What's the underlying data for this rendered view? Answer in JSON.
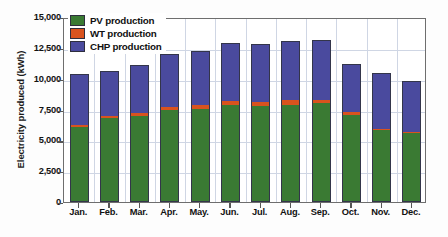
{
  "chart_data": {
    "type": "bar",
    "subtype": "stacked-column",
    "title": "",
    "xlabel": "",
    "ylabel": "Electricity produced (kWh)",
    "categories": [
      "Jan.",
      "Feb.",
      "Mar.",
      "Apr.",
      "May.",
      "Jun.",
      "Jul.",
      "Aug.",
      "Sep.",
      "Oct.",
      "Nov.",
      "Dec."
    ],
    "ylim": [
      0,
      15000
    ],
    "ytick_labels": [
      "0",
      "2,500",
      "5,000",
      "7,500",
      "10,000",
      "12,500",
      "15,000"
    ],
    "ytick_values": [
      0,
      2500,
      5000,
      7500,
      10000,
      12500,
      15000
    ],
    "grid": true,
    "grid_axis": "both",
    "legend_position": "top-left-inside",
    "series": [
      {
        "name": "PV production",
        "color": "#3a7a33",
        "values": [
          6080,
          6800,
          6970,
          7460,
          7540,
          7870,
          7790,
          7870,
          8030,
          7050,
          5880,
          5630
        ]
      },
      {
        "name": "WT production",
        "color": "#d9531e",
        "values": [
          170,
          170,
          250,
          250,
          330,
          330,
          330,
          410,
          250,
          250,
          80,
          80
        ]
      },
      {
        "name": "CHP production",
        "color": "#4a4a9e",
        "values": [
          4130,
          3650,
          3880,
          4290,
          4380,
          4700,
          4700,
          4780,
          4860,
          3880,
          4480,
          4070
        ]
      }
    ],
    "totals": [
      10380,
      10620,
      11100,
      12000,
      12250,
      12900,
      12820,
      13060,
      13140,
      11180,
      10440,
      9780
    ]
  },
  "legend": {
    "items": [
      {
        "label": "PV production",
        "swatch": "legend-swatch-pv"
      },
      {
        "label": "WT production",
        "swatch": "legend-swatch-wt"
      },
      {
        "label": "CHP production",
        "swatch": "legend-swatch-chp"
      }
    ]
  }
}
